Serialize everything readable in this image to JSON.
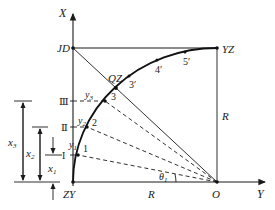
{
  "diagram": {
    "axes": {
      "x_axis_label": "X",
      "y_axis_label": "Y"
    },
    "points": {
      "ZY": "ZY",
      "JD": "JD",
      "QZ": "QZ",
      "YZ": "YZ",
      "O": "O",
      "p1": "1",
      "p2": "2",
      "p3": "3",
      "p3p": "3′",
      "p4p": "4′",
      "p5p": "5′"
    },
    "roman_marks": {
      "I": "I",
      "II": "Ⅱ",
      "III": "Ⅲ"
    },
    "offsets": {
      "y1": "y",
      "y1_sub": "1",
      "y2": "y",
      "y2_sub": "2",
      "y3": "y",
      "y3_sub": "3"
    },
    "dimensions": {
      "x1": "x",
      "x1_sub": "1",
      "x2": "x",
      "x2_sub": "2",
      "x3": "x",
      "x3_sub": "3",
      "radius_vertical": "R",
      "radius_horizontal": "R"
    },
    "angle": {
      "theta": "θ",
      "theta_sub": "1"
    }
  }
}
